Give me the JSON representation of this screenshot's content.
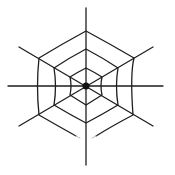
{
  "image": {
    "subject": "spider-web decoration",
    "background": "#ffffff",
    "line_color": "#1e1e1e",
    "center": [
      86,
      86
    ],
    "spokes": [
      {
        "x1": 86,
        "y1": 8,
        "x2": 86,
        "y2": 165
      },
      {
        "x1": 8,
        "y1": 86,
        "x2": 163,
        "y2": 86
      },
      {
        "x1": 19,
        "y1": 47,
        "x2": 153,
        "y2": 126
      },
      {
        "x1": 153,
        "y1": 47,
        "x2": 19,
        "y2": 126
      }
    ],
    "rings": [
      {
        "name": "outer",
        "radius": 57
      },
      {
        "name": "middle",
        "radius": 38
      },
      {
        "name": "inner",
        "radius": 19
      }
    ],
    "hub_radius": 3.5
  }
}
